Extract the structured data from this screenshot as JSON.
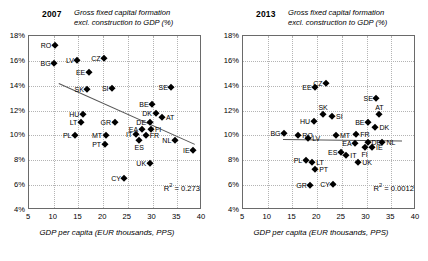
{
  "chart_data": [
    {
      "type": "scatter",
      "panel": "2007",
      "title": "Gross fixed capital formation excl. construction to GDP (%)",
      "title_line1": "Gross fixed capital formation",
      "title_line2": "excl. construction to GDP (%)",
      "year_label": "2007",
      "xlabel": "GDP per capita (EUR thousands, PPS)",
      "ylabel": "",
      "xlim": [
        5,
        40
      ],
      "ylim": [
        4,
        18
      ],
      "xticks": [
        "5",
        "10",
        "15",
        "20",
        "25",
        "30",
        "35",
        "40"
      ],
      "yticks": [
        "4%",
        "6%",
        "8%",
        "10%",
        "12%",
        "14%",
        "16%",
        "18%"
      ],
      "grid": true,
      "legend": "none",
      "annotation": "R² = 0.273",
      "r_squared": 0.273,
      "trendline": {
        "x0": 11.0,
        "y0": 14.2,
        "x1": 38.5,
        "y1": 9.3,
        "slope_sign": "negative"
      },
      "points": [
        {
          "label": "RO",
          "x": 10.2,
          "y": 17.3,
          "lpos": "r"
        },
        {
          "label": "BG",
          "x": 10.1,
          "y": 15.8,
          "lpos": "r"
        },
        {
          "label": "LV",
          "x": 14.8,
          "y": 16.1,
          "lpos": "r"
        },
        {
          "label": "CZ",
          "x": 20.2,
          "y": 16.2,
          "lpos": "r"
        },
        {
          "label": "EE",
          "x": 17.1,
          "y": 15.1,
          "lpos": "r"
        },
        {
          "label": "SK",
          "x": 16.8,
          "y": 13.7,
          "lpos": "r"
        },
        {
          "label": "SI",
          "x": 21.8,
          "y": 13.8,
          "lpos": "r"
        },
        {
          "label": "SE",
          "x": 33.8,
          "y": 13.9,
          "lpos": "r"
        },
        {
          "label": "BE",
          "x": 29.9,
          "y": 12.5,
          "lpos": "r"
        },
        {
          "label": "HU",
          "x": 15.9,
          "y": 11.7,
          "lpos": "r"
        },
        {
          "label": "DK",
          "x": 30.6,
          "y": 11.8,
          "lpos": "r"
        },
        {
          "label": "AT",
          "x": 31.9,
          "y": 11.5,
          "lpos": "l"
        },
        {
          "label": "LT",
          "x": 15.5,
          "y": 11.1,
          "lpos": "r"
        },
        {
          "label": "GR",
          "x": 22.3,
          "y": 11.1,
          "lpos": "r"
        },
        {
          "label": "DE",
          "x": 29.4,
          "y": 11.1,
          "lpos": "r"
        },
        {
          "label": "EA",
          "x": 27.8,
          "y": 10.5,
          "lpos": "r"
        },
        {
          "label": "FI",
          "x": 29.7,
          "y": 10.5,
          "lpos": "l"
        },
        {
          "label": "IT",
          "x": 26.6,
          "y": 10.1,
          "lpos": "r"
        },
        {
          "label": "FR",
          "x": 28.6,
          "y": 10.0,
          "lpos": "l"
        },
        {
          "label": "ES",
          "x": 27.3,
          "y": 9.6,
          "lpos": "b"
        },
        {
          "label": "PL",
          "x": 14.3,
          "y": 10.0,
          "lpos": "r"
        },
        {
          "label": "MT",
          "x": 20.5,
          "y": 10.0,
          "lpos": "r"
        },
        {
          "label": "PT",
          "x": 20.3,
          "y": 9.3,
          "lpos": "r"
        },
        {
          "label": "NL",
          "x": 34.5,
          "y": 9.6,
          "lpos": "r"
        },
        {
          "label": "IE",
          "x": 38.2,
          "y": 8.8,
          "lpos": "r"
        },
        {
          "label": "UK",
          "x": 29.4,
          "y": 7.8,
          "lpos": "r"
        },
        {
          "label": "CY",
          "x": 24.3,
          "y": 6.6,
          "lpos": "r"
        }
      ]
    },
    {
      "type": "scatter",
      "panel": "2013",
      "title": "Gross fixed capital formation excl. construction to GDP (%)",
      "title_line1": "Gross fixed capital formation",
      "title_line2": "excl. construction to GDP (%)",
      "year_label": "2013",
      "xlabel": "GDP per capita (EUR thousands, PPS)",
      "ylabel": "",
      "xlim": [
        5,
        40
      ],
      "ylim": [
        4,
        18
      ],
      "xticks": [
        "5",
        "10",
        "15",
        "20",
        "25",
        "30",
        "35",
        "40"
      ],
      "yticks": [
        "4%",
        "6%",
        "8%",
        "10%",
        "12%",
        "14%",
        "16%",
        "18%"
      ],
      "grid": true,
      "legend": "none",
      "annotation": "R² = 0.0012",
      "r_squared": 0.0012,
      "trendline": {
        "x0": 13.0,
        "y0": 9.75,
        "x1": 37.0,
        "y1": 9.62,
        "slope_sign": "flat"
      },
      "points": [
        {
          "label": "CZ",
          "x": 21.8,
          "y": 14.2,
          "lpos": "r"
        },
        {
          "label": "EE",
          "x": 19.6,
          "y": 13.9,
          "lpos": "r"
        },
        {
          "label": "SE",
          "x": 32.0,
          "y": 13.0,
          "lpos": "r"
        },
        {
          "label": "SK",
          "x": 21.2,
          "y": 11.7,
          "lpos": "t"
        },
        {
          "label": "SI",
          "x": 23.0,
          "y": 11.6,
          "lpos": "l"
        },
        {
          "label": "AT",
          "x": 32.6,
          "y": 11.7,
          "lpos": "t"
        },
        {
          "label": "HU",
          "x": 19.3,
          "y": 11.2,
          "lpos": "r"
        },
        {
          "label": "BE",
          "x": 30.3,
          "y": 11.1,
          "lpos": "r"
        },
        {
          "label": "DK",
          "x": 31.8,
          "y": 10.7,
          "lpos": "l"
        },
        {
          "label": "BG",
          "x": 13.3,
          "y": 10.2,
          "lpos": "r"
        },
        {
          "label": "RO",
          "x": 16.2,
          "y": 10.0,
          "lpos": "l"
        },
        {
          "label": "LV",
          "x": 18.2,
          "y": 9.8,
          "lpos": "l"
        },
        {
          "label": "MT",
          "x": 23.8,
          "y": 10.0,
          "lpos": "l"
        },
        {
          "label": "FR",
          "x": 27.9,
          "y": 10.1,
          "lpos": "l"
        },
        {
          "label": "EA",
          "x": 27.7,
          "y": 9.4,
          "lpos": "r"
        },
        {
          "label": "DE",
          "x": 30.2,
          "y": 9.5,
          "lpos": "l"
        },
        {
          "label": "NL",
          "x": 33.2,
          "y": 9.5,
          "lpos": "l"
        },
        {
          "label": "FI",
          "x": 29.6,
          "y": 9.1,
          "lpos": "b"
        },
        {
          "label": "IE",
          "x": 31.1,
          "y": 9.1,
          "lpos": "l"
        },
        {
          "label": "ES",
          "x": 24.8,
          "y": 8.7,
          "lpos": "r"
        },
        {
          "label": "IT",
          "x": 25.9,
          "y": 8.4,
          "lpos": "l"
        },
        {
          "label": "PL",
          "x": 17.7,
          "y": 8.0,
          "lpos": "r"
        },
        {
          "label": "LT",
          "x": 19.0,
          "y": 7.9,
          "lpos": "l"
        },
        {
          "label": "UK",
          "x": 28.3,
          "y": 7.9,
          "lpos": "l"
        },
        {
          "label": "PT",
          "x": 19.6,
          "y": 7.3,
          "lpos": "l"
        },
        {
          "label": "GR",
          "x": 18.6,
          "y": 6.0,
          "lpos": "r"
        },
        {
          "label": "CY",
          "x": 23.3,
          "y": 6.1,
          "lpos": "r"
        }
      ]
    }
  ]
}
